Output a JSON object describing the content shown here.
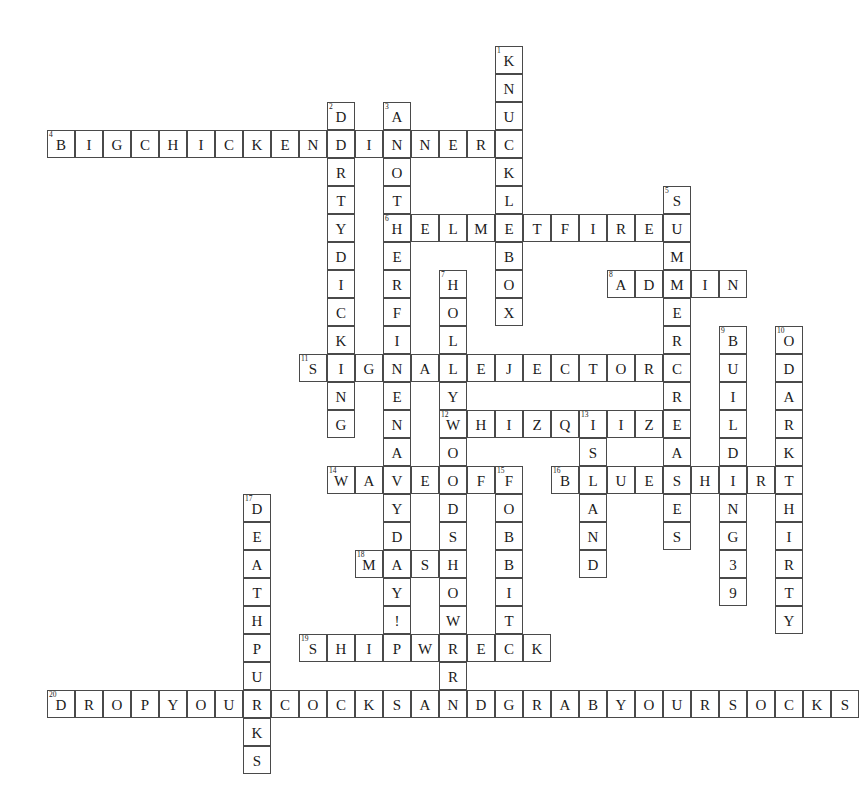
{
  "puzzle": {
    "kind": "crossword-grid",
    "cell_size": 28,
    "origin_x": 47,
    "origin_y": 46,
    "grid_cols": 29,
    "grid_rows": 26,
    "cell_fill": "#ffffff",
    "cell_border": "#4a4a4a",
    "text_color": "#1a1a1a",
    "background": "#ffffff"
  },
  "entries": [
    {
      "number": "1",
      "direction": "down",
      "answer": "KNUCKLEBOX",
      "row": 0,
      "col": 16
    },
    {
      "number": "2",
      "direction": "down",
      "answer": "DIRTYDICKING",
      "row": 2,
      "col": 10
    },
    {
      "number": "3",
      "direction": "down",
      "answer": "ANOTHERFINENAVYDAY!",
      "row": 2,
      "col": 12
    },
    {
      "number": "4",
      "direction": "across",
      "answer": "BIGCHICKENDINNER",
      "row": 3,
      "col": 0
    },
    {
      "number": "5",
      "direction": "down",
      "answer": "SUMMERCREASES",
      "row": 5,
      "col": 22
    },
    {
      "number": "6",
      "direction": "across",
      "answer": "HELMETFIRE",
      "row": 6,
      "col": 12
    },
    {
      "number": "7",
      "direction": "down",
      "answer": "HOLLYWOODSHOWER",
      "row": 8,
      "col": 14
    },
    {
      "number": "8",
      "direction": "across",
      "answer": "ADMIN",
      "row": 8,
      "col": 20
    },
    {
      "number": "9",
      "direction": "down",
      "answer": "BUILDING39",
      "row": 10,
      "col": 24
    },
    {
      "number": "10",
      "direction": "down",
      "answer": "ODARKTHIRTY",
      "row": 10,
      "col": 26
    },
    {
      "number": "11",
      "direction": "across",
      "answer": "SIGNALEJECTOR",
      "row": 11,
      "col": 9
    },
    {
      "number": "12",
      "direction": "across",
      "answer": "WHIZQUIZ",
      "row": 13,
      "col": 14
    },
    {
      "number": "13",
      "direction": "down",
      "answer": "ISLAND",
      "row": 13,
      "col": 19
    },
    {
      "number": "14",
      "direction": "across",
      "answer": "WAVEOFF",
      "row": 15,
      "col": 10
    },
    {
      "number": "15",
      "direction": "down",
      "answer": "FOBBIT",
      "row": 15,
      "col": 16
    },
    {
      "number": "16",
      "direction": "across",
      "answer": "BLUESHIRT",
      "row": 15,
      "col": 18
    },
    {
      "number": "17",
      "direction": "down",
      "answer": "DEATHPUCKS",
      "row": 16,
      "col": 7
    },
    {
      "number": "18",
      "direction": "across",
      "answer": "MASH",
      "row": 18,
      "col": 11
    },
    {
      "number": "19",
      "direction": "across",
      "answer": "SHIPWRECK",
      "row": 21,
      "col": 9
    },
    {
      "number": "20",
      "direction": "across",
      "answer": "DROPYOURCOCKSANDGRABYOURSOCKS",
      "row": 23,
      "col": 0
    }
  ]
}
